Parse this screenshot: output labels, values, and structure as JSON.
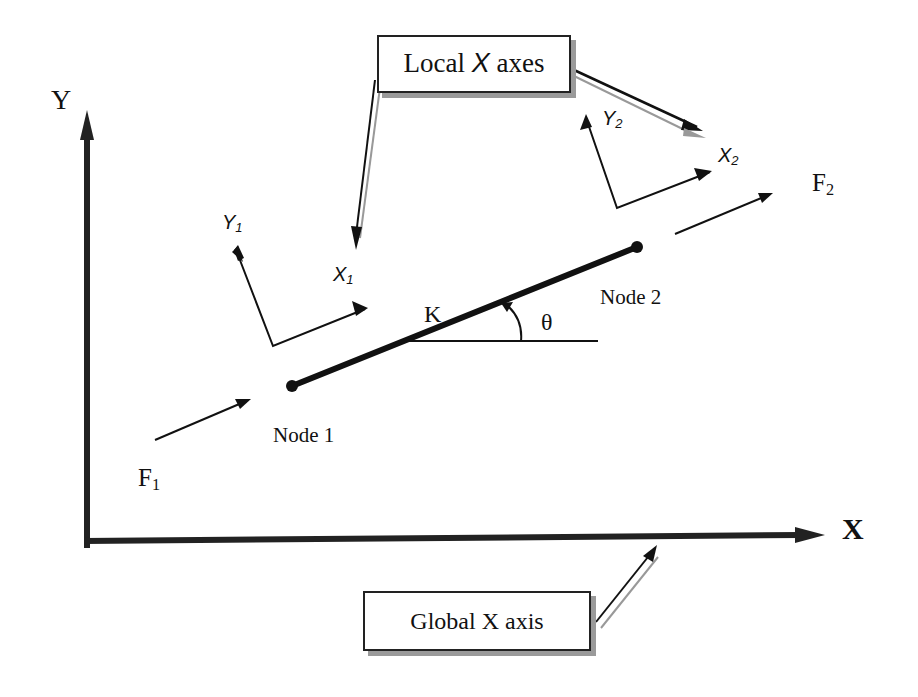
{
  "diagram": {
    "type": "truss element local vs global coordinate systems",
    "global_axes": {
      "x_label": "X",
      "y_label": "Y"
    },
    "callouts": {
      "local": {
        "prefix": "Local ",
        "italic": "X",
        "suffix": " axes"
      },
      "global": {
        "text": "Global X axis"
      }
    },
    "element": {
      "stiffness_label": "K",
      "angle_label": "θ",
      "nodes": [
        {
          "id": 1,
          "label": "Node 1"
        },
        {
          "id": 2,
          "label": "Node 2"
        }
      ]
    },
    "local_axes": {
      "node1": {
        "x": "X",
        "x_sub": "1",
        "y": "Y",
        "y_sub": "1"
      },
      "node2": {
        "x": "X",
        "x_sub": "2",
        "y": "Y",
        "y_sub": "2"
      }
    },
    "forces": {
      "f1": {
        "base": "F",
        "sub": "1"
      },
      "f2": {
        "base": "F",
        "sub": "2"
      }
    },
    "colors": {
      "ink": "#111111",
      "shadow": "#9a9a9a",
      "background": "#ffffff"
    }
  }
}
